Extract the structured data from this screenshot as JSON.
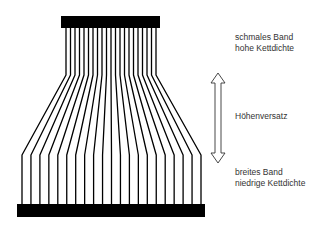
{
  "diagram": {
    "colors": {
      "ink": "#000000",
      "text": "#333333",
      "background": "#ffffff"
    },
    "thread_count": 21,
    "top_bar": {
      "x": 61,
      "y": 16,
      "width": 99,
      "height": 12
    },
    "bottom_bar": {
      "x": 17,
      "y": 204,
      "width": 188,
      "height": 13
    },
    "threads": {
      "top_x_start": 66,
      "top_x_end": 156,
      "bottom_x_start": 22,
      "bottom_x_end": 201,
      "y_top": 28,
      "y_bend_top": 75,
      "y_bend_bottom": 155,
      "y_bottom": 204,
      "stroke_width": 1.3
    },
    "arrow": {
      "x_center": 218,
      "y_top": 73,
      "y_bottom": 163,
      "head_half_width": 7,
      "shaft_half_width": 3,
      "head_length": 10,
      "icon": "double-headed-vertical-arrow"
    }
  },
  "labels": {
    "top": {
      "line1": "schmales Band",
      "line2": "hohe Kettdichte"
    },
    "middle": {
      "line1": "Höhenversatz"
    },
    "bottom": {
      "line1": "breites Band",
      "line2": "niedrige Kettdichte"
    }
  }
}
